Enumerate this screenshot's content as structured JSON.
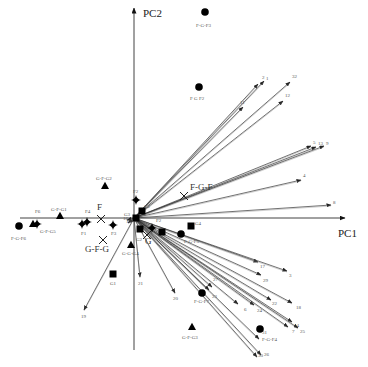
{
  "chart_data": {
    "type": "scatter",
    "subtype": "pca-biplot",
    "title": "",
    "xlabel": "PC1",
    "ylabel": "PC2",
    "grid": false,
    "legend": null,
    "origin_px": [
      134,
      218
    ],
    "axes": {
      "x": {
        "label": "PC1",
        "from_px": [
          20,
          218
        ],
        "to_px": [
          345,
          218
        ]
      },
      "y": {
        "label": "PC2",
        "from_px": [
          134,
          350
        ],
        "to_px": [
          134,
          8
        ]
      }
    },
    "samples": [
      {
        "label": "F-G-F3",
        "shape": "circle",
        "px": [
          205,
          12
        ],
        "label_px": [
          196,
          27
        ]
      },
      {
        "label": "F G F2",
        "shape": "circle",
        "px": [
          199,
          87
        ],
        "label_px": [
          190,
          100
        ]
      },
      {
        "label": "F-G-F6",
        "shape": "circle",
        "px": [
          19,
          226
        ],
        "label_px": [
          11,
          240
        ]
      },
      {
        "label": "F-G-F5",
        "shape": "circle",
        "px": [
          181,
          234
        ],
        "label_px": [
          184,
          243
        ]
      },
      {
        "label": "F-G-F7",
        "shape": "circle",
        "px": [
          202,
          293
        ],
        "label_px": [
          194,
          303
        ]
      },
      {
        "label": "F-G-F4",
        "shape": "circle",
        "px": [
          260,
          329
        ],
        "label_px": [
          262,
          341
        ]
      },
      {
        "label": "G-F-G2",
        "shape": "triangle",
        "px": [
          105,
          186
        ],
        "label_px": [
          96,
          180
        ]
      },
      {
        "label": "G-F-G1",
        "shape": "triangle",
        "px": [
          60,
          216
        ],
        "label_px": [
          51,
          211
        ]
      },
      {
        "label": "G-F-G5",
        "shape": "triangle",
        "px": [
          33,
          224
        ],
        "label_px": [
          40,
          233
        ]
      },
      {
        "label": "G-G-G4",
        "shape": "triangle",
        "px": [
          131,
          245
        ],
        "label_px": [
          122,
          255
        ]
      },
      {
        "label": "G-F-G3",
        "shape": "triangle",
        "px": [
          192,
          327
        ],
        "label_px": [
          182,
          339
        ]
      },
      {
        "label": "G1",
        "shape": "square",
        "px": [
          113,
          274
        ],
        "label_px": [
          110,
          285
        ]
      },
      {
        "label": "G3",
        "shape": "square",
        "px": [
          136,
          218
        ],
        "label_px": [
          124,
          216
        ]
      },
      {
        "label": "G2",
        "shape": "square",
        "px": [
          142,
          211
        ],
        "label_px": [
          144,
          208
        ]
      },
      {
        "label": "G2b",
        "shape": "square",
        "px": [
          140,
          229
        ],
        "label_px": [
          136,
          241
        ]
      },
      {
        "label": "",
        "shape": "square",
        "px": [
          162,
          232
        ],
        "label_px": null
      },
      {
        "label": "G4",
        "shape": "square",
        "px": [
          191,
          226
        ],
        "label_px": [
          195,
          225
        ]
      },
      {
        "label": "F6",
        "shape": "diamond",
        "px": [
          37,
          224
        ],
        "label_px": [
          35,
          213
        ]
      },
      {
        "label": "F4",
        "shape": "diamond",
        "px": [
          87,
          222
        ],
        "label_px": [
          85,
          213
        ]
      },
      {
        "label": "F1",
        "shape": "diamond",
        "px": [
          82,
          224
        ],
        "label_px": [
          81,
          235
        ]
      },
      {
        "label": "F3",
        "shape": "diamond",
        "px": [
          113,
          225
        ],
        "label_px": [
          111,
          235
        ]
      },
      {
        "label": "F2",
        "shape": "diamond",
        "px": [
          136,
          200
        ],
        "label_px": [
          133,
          193
        ]
      },
      {
        "label": "F2b",
        "shape": "diamond",
        "px": [
          152,
          228
        ],
        "label_px": [
          156,
          222
        ]
      }
    ],
    "group_centroids": [
      {
        "label": "F",
        "px": [
          101,
          219
        ],
        "label_px": [
          97,
          210
        ]
      },
      {
        "label": "G-F-G",
        "px": [
          103,
          240
        ],
        "label_px": [
          85,
          252
        ]
      },
      {
        "label": "F-G-F",
        "px": [
          184,
          196
        ],
        "label_px": [
          190,
          190
        ]
      },
      {
        "label": "G",
        "px": [
          147,
          235
        ],
        "label_px": [
          145,
          244
        ]
      }
    ],
    "vectors": [
      {
        "label": "1",
        "tip_px": [
          264,
          81
        ],
        "label_px": [
          266,
          80
        ]
      },
      {
        "label": "2",
        "tip_px": [
          258,
          84
        ],
        "label_px": [
          262,
          79
        ]
      },
      {
        "label": "11",
        "tip_px": [
          243,
          107
        ],
        "label_px": [
          240,
          104
        ]
      },
      {
        "label": "12",
        "tip_px": [
          283,
          101
        ],
        "label_px": [
          285,
          97
        ]
      },
      {
        "label": "32",
        "tip_px": [
          290,
          82
        ],
        "label_px": [
          292,
          78
        ]
      },
      {
        "label": "5",
        "tip_px": [
          311,
          146
        ],
        "label_px": [
          313,
          144
        ]
      },
      {
        "label": "13",
        "tip_px": [
          316,
          147
        ],
        "label_px": [
          318,
          145
        ]
      },
      {
        "label": "9",
        "tip_px": [
          324,
          146
        ],
        "label_px": [
          326,
          145
        ]
      },
      {
        "label": "4",
        "tip_px": [
          301,
          180
        ],
        "label_px": [
          303,
          177
        ]
      },
      {
        "label": "8",
        "tip_px": [
          331,
          205
        ],
        "label_px": [
          333,
          204
        ]
      },
      {
        "label": "17",
        "tip_px": [
          258,
          262
        ],
        "label_px": [
          260,
          268
        ]
      },
      {
        "label": "3",
        "tip_px": [
          287,
          271
        ],
        "label_px": [
          289,
          277
        ]
      },
      {
        "label": "29",
        "tip_px": [
          261,
          275
        ],
        "label_px": [
          263,
          282
        ]
      },
      {
        "label": "22",
        "tip_px": [
          271,
          300
        ],
        "label_px": [
          272,
          305
        ]
      },
      {
        "label": "18",
        "tip_px": [
          292,
          303
        ],
        "label_px": [
          296,
          309
        ]
      },
      {
        "label": "24",
        "tip_px": [
          254,
          305
        ],
        "label_px": [
          257,
          312
        ]
      },
      {
        "label": "6",
        "tip_px": [
          238,
          304
        ],
        "label_px": [
          244,
          311
        ]
      },
      {
        "label": "14",
        "tip_px": [
          292,
          322
        ],
        "label_px": [
          294,
          327
        ]
      },
      {
        "label": "25",
        "tip_px": [
          298,
          328
        ],
        "label_px": [
          300,
          333
        ]
      },
      {
        "label": "7",
        "tip_px": [
          288,
          327
        ],
        "label_px": [
          292,
          333
        ]
      },
      {
        "label": "26",
        "tip_px": [
          261,
          355
        ],
        "label_px": [
          264,
          356
        ]
      },
      {
        "label": "30",
        "tip_px": [
          257,
          357
        ],
        "label_px": [
          258,
          357
        ]
      },
      {
        "label": "31",
        "tip_px": [
          259,
          339
        ],
        "label_px": [
          262,
          334
        ]
      },
      {
        "label": "23",
        "tip_px": [
          209,
          290
        ],
        "label_px": [
          212,
          298
        ]
      },
      {
        "label": "27",
        "tip_px": [
          212,
          287
        ],
        "label_px": [
          213,
          281
        ]
      },
      {
        "label": "21",
        "tip_px": [
          140,
          277
        ],
        "label_px": [
          138,
          285
        ]
      },
      {
        "label": "20",
        "tip_px": [
          175,
          293
        ],
        "label_px": [
          173,
          300
        ]
      },
      {
        "label": "19",
        "tip_px": [
          84,
          310
        ],
        "label_px": [
          81,
          318
        ]
      },
      {
        "label": "15",
        "tip_px": [
          128,
          223
        ],
        "label_px": [
          126,
          223
        ]
      },
      {
        "label": "16",
        "tip_px": [
          127,
          220
        ],
        "label_px": [
          123,
          220
        ]
      }
    ]
  }
}
